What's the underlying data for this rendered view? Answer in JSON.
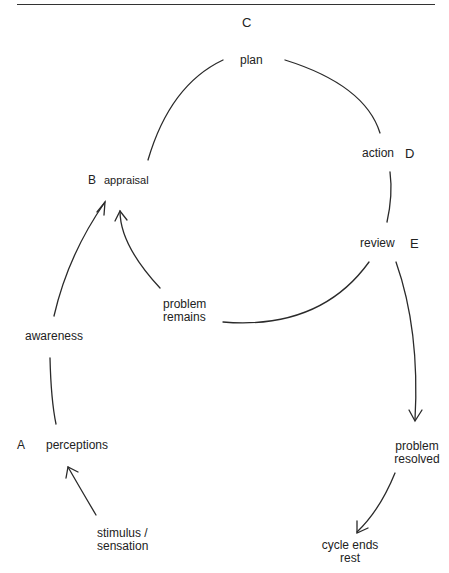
{
  "diagram": {
    "type": "cycle",
    "nodes": {
      "C": {
        "letter": "C",
        "label": "plan"
      },
      "D": {
        "letter": "D",
        "label": "action"
      },
      "B": {
        "letter": "B",
        "label": "appraisal"
      },
      "E": {
        "letter": "E",
        "label": "review"
      },
      "A": {
        "letter": "A",
        "label": "perceptions"
      }
    },
    "labels": {
      "awareness": "awareness",
      "problem_remains_1": "problem",
      "problem_remains_2": "remains",
      "problem_resolved_1": "problem",
      "problem_resolved_2": "resolved",
      "stimulus_1": "stimulus /",
      "stimulus_2": "sensation",
      "cycle_ends_1": "cycle ends",
      "cycle_ends_2": "rest"
    },
    "edges": [
      {
        "from": "stimulus / sensation",
        "to": "perceptions",
        "arrow": true
      },
      {
        "from": "perceptions",
        "to": "awareness",
        "arrow": false
      },
      {
        "from": "awareness",
        "to": "appraisal",
        "arrow": true
      },
      {
        "from": "appraisal",
        "to": "plan",
        "arrow": false
      },
      {
        "from": "plan",
        "to": "action",
        "arrow": false
      },
      {
        "from": "action",
        "to": "review",
        "arrow": false
      },
      {
        "from": "review",
        "to": "problem remains",
        "arrow": false
      },
      {
        "from": "problem remains",
        "to": "appraisal",
        "arrow": true
      },
      {
        "from": "review",
        "to": "problem resolved",
        "arrow": true
      },
      {
        "from": "problem resolved",
        "to": "cycle ends / rest",
        "arrow": true
      }
    ]
  }
}
